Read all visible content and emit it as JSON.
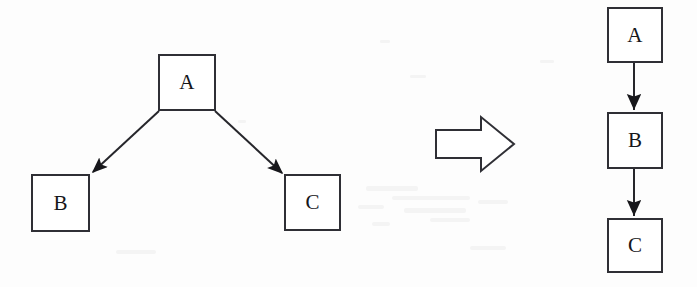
{
  "figure": {
    "background_color": "#fdfdfd",
    "stroke_color": "#2f2f35",
    "label_color": "#16161a",
    "width": 697,
    "height": 287
  },
  "left_graph": {
    "name": "before-graph",
    "caption": "",
    "nodes": [
      {
        "id": "A",
        "label": "A",
        "x": 158,
        "y": 54,
        "w": 58,
        "h": 57
      },
      {
        "id": "B",
        "label": "B",
        "x": 31,
        "y": 174,
        "w": 59,
        "h": 58
      },
      {
        "id": "C",
        "label": "C",
        "x": 284,
        "y": 174,
        "w": 57,
        "h": 57
      }
    ],
    "edges": [
      {
        "from": "A",
        "to": "B",
        "style": "solid",
        "arrowhead": "filled-triangle"
      },
      {
        "from": "A",
        "to": "C",
        "style": "solid",
        "arrowhead": "filled-triangle"
      }
    ]
  },
  "transform_arrow": {
    "name": "implies-block-arrow",
    "label": "",
    "direction": "right",
    "symbol": "⇒"
  },
  "right_graph": {
    "name": "after-graph",
    "caption": "",
    "nodes": [
      {
        "id": "A",
        "label": "A",
        "x": 607,
        "y": 7,
        "w": 56,
        "h": 56
      },
      {
        "id": "B",
        "label": "B",
        "x": 607,
        "y": 112,
        "w": 56,
        "h": 57
      },
      {
        "id": "C",
        "label": "C",
        "x": 607,
        "y": 218,
        "w": 56,
        "h": 55
      }
    ],
    "edges": [
      {
        "from": "A",
        "to": "B",
        "style": "solid",
        "arrowhead": "filled-triangle"
      },
      {
        "from": "B",
        "to": "C",
        "style": "solid",
        "arrowhead": "filled-triangle"
      }
    ]
  }
}
